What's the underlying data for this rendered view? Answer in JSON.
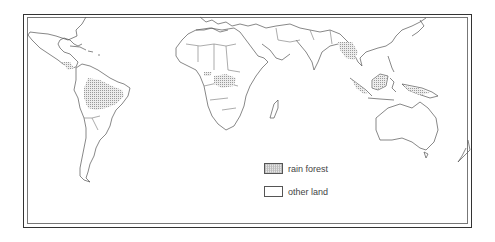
{
  "map": {
    "title": "",
    "projection": "world outline map with country borders",
    "colors": {
      "border": "#333333",
      "land_outline": "#555555",
      "rain_forest_fill": "#d9d9d9",
      "other_land_fill": "#ffffff"
    },
    "rain_forest_regions": [
      "Amazon Basin (South America)",
      "Central America",
      "Congo Basin (Central Africa)",
      "West Africa coast",
      "Southeast Asia",
      "Indonesia / Borneo",
      "New Guinea"
    ]
  },
  "legend": {
    "items": [
      {
        "label": "rain forest",
        "swatch": "hatched"
      },
      {
        "label": "other land",
        "swatch": "empty"
      }
    ]
  }
}
